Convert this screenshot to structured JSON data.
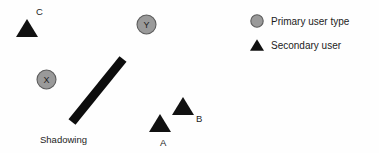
{
  "figure": {
    "name": "shadowing-scenario-diagram",
    "background_color": "#fefefe"
  },
  "colors": {
    "primary_marker_fill": "#9a9a9a",
    "primary_marker_stroke": "#5d5d5d",
    "secondary_marker_fill": "#111111",
    "shadowing_bar": "#0d0d0d",
    "text": "#1c1c1c"
  },
  "primary_users": [
    {
      "id": "X",
      "label": "X",
      "marker": "primary-user-circle",
      "cx": 46.5,
      "cy": 79.5,
      "r": 9.5
    },
    {
      "id": "Y",
      "label": "Y",
      "marker": "primary-user-circle",
      "cx": 146.5,
      "cy": 24.5,
      "r": 9.5
    }
  ],
  "secondary_users": [
    {
      "id": "C",
      "label": "C",
      "marker": "secondary-user-triangle",
      "cx": 27,
      "cy": 28,
      "size": 11,
      "label_x": 36,
      "label_y": 15
    },
    {
      "id": "A",
      "label": "A",
      "marker": "secondary-user-triangle",
      "cx": 160,
      "cy": 123,
      "size": 11,
      "label_x": 160,
      "label_y": 146
    },
    {
      "id": "B",
      "label": "B",
      "marker": "secondary-user-triangle",
      "cx": 183,
      "cy": 106,
      "size": 11,
      "label_x": 196,
      "label_y": 122
    }
  ],
  "obstacle": {
    "label": "Shadowing",
    "label_x": 40,
    "label_y": 143,
    "bar": {
      "x1": 72,
      "y1": 122,
      "x2": 123,
      "y2": 59,
      "thickness": 9
    }
  },
  "legend": {
    "x": 257,
    "items": [
      {
        "marker": "primary-user-circle",
        "label": "Primary user type",
        "y": 21,
        "text_x": 271
      },
      {
        "marker": "secondary-user-triangle",
        "label": "Secondary user",
        "y": 45,
        "text_x": 271
      }
    ]
  }
}
